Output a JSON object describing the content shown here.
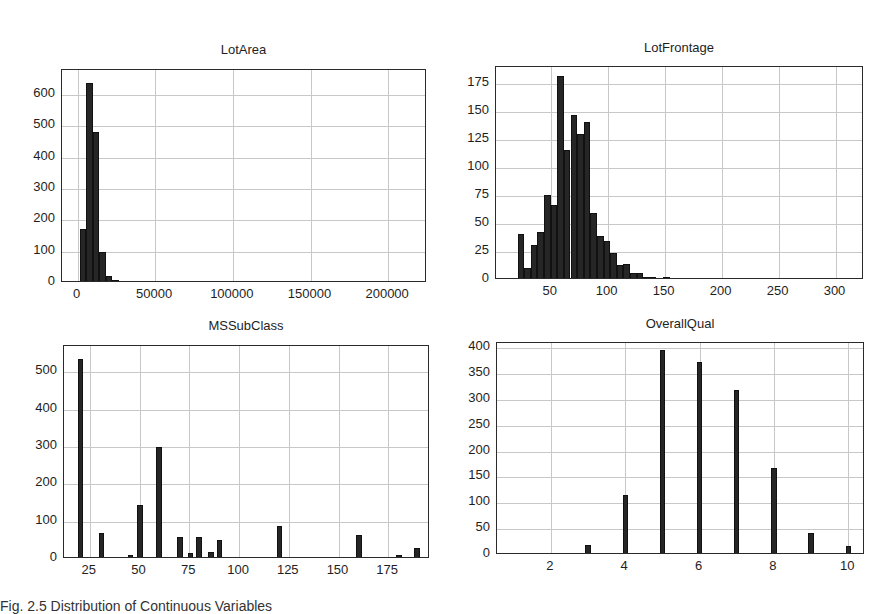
{
  "figure": {
    "caption": "Fig. 2.5 Distribution of Continuous Variables"
  },
  "chart_data": [
    {
      "type": "bar",
      "title": "LotArea",
      "xlabel": "",
      "ylabel": "",
      "xlim": [
        -10000,
        225000
      ],
      "ylim": [
        0,
        680
      ],
      "xticks": [
        0,
        50000,
        100000,
        150000,
        200000
      ],
      "xtick_labels": [
        "0",
        "50000",
        "100000",
        "150000",
        "200000"
      ],
      "yticks": [
        0,
        100,
        200,
        300,
        400,
        500,
        600
      ],
      "grid": true,
      "bins": [
        {
          "x0": 1300,
          "x1": 5500,
          "value": 172
        },
        {
          "x0": 5500,
          "x1": 9700,
          "value": 638
        },
        {
          "x0": 9700,
          "x1": 13900,
          "value": 482
        },
        {
          "x0": 13900,
          "x1": 18100,
          "value": 98
        },
        {
          "x0": 18100,
          "x1": 22300,
          "value": 22
        },
        {
          "x0": 22300,
          "x1": 26500,
          "value": 8
        },
        {
          "x0": 26500,
          "x1": 30700,
          "value": 3
        },
        {
          "x0": 30700,
          "x1": 34900,
          "value": 2
        },
        {
          "x0": 34900,
          "x1": 39100,
          "value": 1
        },
        {
          "x0": 52000,
          "x1": 56200,
          "value": 1
        },
        {
          "x0": 60000,
          "x1": 64200,
          "value": 1
        },
        {
          "x0": 113000,
          "x1": 117200,
          "value": 1
        },
        {
          "x0": 159000,
          "x1": 163200,
          "value": 1
        },
        {
          "x0": 211000,
          "x1": 215200,
          "value": 1
        }
      ]
    },
    {
      "type": "bar",
      "title": "LotFrontage",
      "xlabel": "",
      "ylabel": "",
      "xlim": [
        2,
        325
      ],
      "ylim": [
        0,
        190
      ],
      "xticks": [
        50,
        100,
        150,
        200,
        250,
        300
      ],
      "xtick_labels": [
        "50",
        "100",
        "150",
        "200",
        "250",
        "300"
      ],
      "yticks": [
        0,
        25,
        50,
        75,
        100,
        125,
        150,
        175
      ],
      "grid": true,
      "bins": [
        {
          "x0": 21,
          "x1": 26.8,
          "value": 41
        },
        {
          "x0": 26.8,
          "x1": 32.6,
          "value": 11
        },
        {
          "x0": 32.6,
          "x1": 38.4,
          "value": 31
        },
        {
          "x0": 38.4,
          "x1": 44.2,
          "value": 43
        },
        {
          "x0": 44.2,
          "x1": 50.0,
          "value": 76
        },
        {
          "x0": 50.0,
          "x1": 55.8,
          "value": 67
        },
        {
          "x0": 55.8,
          "x1": 61.6,
          "value": 182
        },
        {
          "x0": 61.6,
          "x1": 67.4,
          "value": 116
        },
        {
          "x0": 67.4,
          "x1": 73.2,
          "value": 147
        },
        {
          "x0": 73.2,
          "x1": 79.0,
          "value": 130
        },
        {
          "x0": 79.0,
          "x1": 84.8,
          "value": 141
        },
        {
          "x0": 84.8,
          "x1": 90.6,
          "value": 60
        },
        {
          "x0": 90.6,
          "x1": 96.4,
          "value": 39
        },
        {
          "x0": 96.4,
          "x1": 102.2,
          "value": 35
        },
        {
          "x0": 102.2,
          "x1": 108.0,
          "value": 24
        },
        {
          "x0": 108.0,
          "x1": 113.8,
          "value": 13
        },
        {
          "x0": 113.8,
          "x1": 119.6,
          "value": 14
        },
        {
          "x0": 119.6,
          "x1": 125.4,
          "value": 6
        },
        {
          "x0": 125.4,
          "x1": 131.2,
          "value": 6
        },
        {
          "x0": 131.2,
          "x1": 137.0,
          "value": 3
        },
        {
          "x0": 137.0,
          "x1": 142.8,
          "value": 3
        },
        {
          "x0": 142.8,
          "x1": 148.6,
          "value": 2
        },
        {
          "x0": 148.6,
          "x1": 154.4,
          "value": 3
        },
        {
          "x0": 171.8,
          "x1": 177.6,
          "value": 1
        },
        {
          "x0": 305.0,
          "x1": 313.0,
          "value": 2
        }
      ]
    },
    {
      "type": "bar",
      "title": "MSSubClass",
      "xlabel": "",
      "ylabel": "",
      "xlim": [
        12,
        196
      ],
      "ylim": [
        0,
        570
      ],
      "xticks": [
        25,
        50,
        75,
        100,
        125,
        150,
        175
      ],
      "xtick_labels": [
        "25",
        "50",
        "75",
        "100",
        "125",
        "150",
        "175"
      ],
      "yticks": [
        0,
        100,
        200,
        300,
        400,
        500
      ],
      "grid": true,
      "bins": [
        {
          "x0": 19.0,
          "x1": 21.8,
          "value": 536
        },
        {
          "x0": 29.5,
          "x1": 32.3,
          "value": 69
        },
        {
          "x0": 39.0,
          "x1": 41.8,
          "value": 4
        },
        {
          "x0": 44.0,
          "x1": 46.8,
          "value": 12
        },
        {
          "x0": 48.8,
          "x1": 51.6,
          "value": 144
        },
        {
          "x0": 58.5,
          "x1": 61.3,
          "value": 299
        },
        {
          "x0": 68.8,
          "x1": 71.6,
          "value": 60
        },
        {
          "x0": 74.3,
          "x1": 77.1,
          "value": 16
        },
        {
          "x0": 78.5,
          "x1": 81.3,
          "value": 58
        },
        {
          "x0": 84.5,
          "x1": 87.3,
          "value": 20
        },
        {
          "x0": 88.8,
          "x1": 91.6,
          "value": 52
        },
        {
          "x0": 119.0,
          "x1": 121.8,
          "value": 87
        },
        {
          "x0": 159.0,
          "x1": 161.8,
          "value": 63
        },
        {
          "x0": 179.0,
          "x1": 181.8,
          "value": 10
        },
        {
          "x0": 188.0,
          "x1": 190.8,
          "value": 30
        }
      ]
    },
    {
      "type": "bar",
      "title": "OverallQual",
      "xlabel": "",
      "ylabel": "",
      "xlim": [
        0.55,
        10.45
      ],
      "ylim": [
        0,
        410
      ],
      "xticks": [
        2,
        4,
        6,
        8,
        10
      ],
      "xtick_labels": [
        "2",
        "4",
        "6",
        "8",
        "10"
      ],
      "yticks": [
        0,
        50,
        100,
        150,
        200,
        250,
        300,
        350,
        400
      ],
      "grid": true,
      "bins": [
        {
          "x0": 0.93,
          "x1": 1.07,
          "value": 2
        },
        {
          "x0": 1.93,
          "x1": 2.07,
          "value": 3
        },
        {
          "x0": 2.93,
          "x1": 3.07,
          "value": 20
        },
        {
          "x0": 3.93,
          "x1": 4.07,
          "value": 116
        },
        {
          "x0": 4.93,
          "x1": 5.07,
          "value": 397
        },
        {
          "x0": 5.93,
          "x1": 6.07,
          "value": 374
        },
        {
          "x0": 6.93,
          "x1": 7.07,
          "value": 319
        },
        {
          "x0": 7.93,
          "x1": 8.07,
          "value": 168
        },
        {
          "x0": 8.93,
          "x1": 9.07,
          "value": 43
        },
        {
          "x0": 9.93,
          "x1": 10.07,
          "value": 18
        }
      ]
    }
  ],
  "layout": {
    "panels": [
      {
        "title_top": 42,
        "frame": {
          "left": 61,
          "top": 69,
          "width": 365,
          "height": 213
        }
      },
      {
        "title_top": 40,
        "frame": {
          "left": 495,
          "top": 66,
          "width": 368,
          "height": 213
        }
      },
      {
        "title_top": 318,
        "frame": {
          "left": 63,
          "top": 345,
          "width": 366,
          "height": 213
        }
      },
      {
        "title_top": 316,
        "frame": {
          "left": 496,
          "top": 342,
          "width": 368,
          "height": 212
        }
      }
    ]
  }
}
